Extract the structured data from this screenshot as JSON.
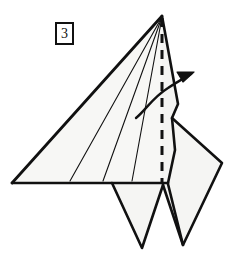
{
  "diagram": {
    "step_number": "3",
    "canvas": {
      "width": 237,
      "height": 263
    },
    "colors": {
      "stroke": "#111111",
      "paper_fill": "#f7f7f5",
      "paper_fill_shaded": "#f2f2f0",
      "background": "#ffffff",
      "crease_line": "#111111",
      "fold_dash": "#111111",
      "arrow": "#111111"
    },
    "shapes": {
      "main_body": {
        "label": "large triangular paper panel",
        "points": "162,16 12,183 162,183"
      },
      "right_upper_panel": {
        "label": "narrow right panel beside valley fold",
        "points": "162,16 178,104 172,118 175,150 162,183"
      },
      "right_flap": {
        "label": "right rear quadrilateral flap",
        "points": "172,118 222,163 183,245 163,185"
      },
      "left_leg": {
        "label": "left lower triangular leg",
        "points": "112,183 162,183 142,248"
      },
      "right_leg": {
        "label": "right lower triangular leg",
        "points": "162,183 182,186 183,245"
      }
    },
    "crease_lines": [
      {
        "name": "crease-line-1",
        "x1": 162,
        "y1": 17,
        "x2": 70,
        "y2": 181
      },
      {
        "name": "crease-line-2",
        "x1": 162,
        "y1": 17,
        "x2": 103,
        "y2": 181
      },
      {
        "name": "crease-line-3",
        "x1": 162,
        "y1": 17,
        "x2": 132,
        "y2": 181
      }
    ],
    "valley_fold": {
      "name": "valley-fold-dashed-line",
      "x1": 162,
      "y1": 18,
      "x2": 162,
      "y2": 183,
      "dash_pattern": "9 7",
      "stroke_width": 3
    },
    "arrow": {
      "name": "fold-direction-arrow",
      "path": "M 136,118 C 146,110 154,96 170,86 C 178,81 186,77 192,74",
      "head": "192,73 178,73 183,82",
      "description": "curved arrow indicating fold to the right"
    },
    "outline_stroke_width": 2.6,
    "crease_stroke_width": 1.1
  }
}
